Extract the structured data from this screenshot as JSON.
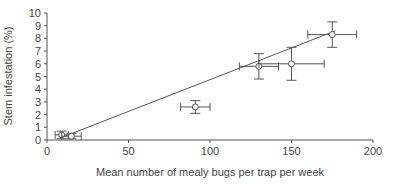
{
  "chart_data": {
    "type": "scatter",
    "title": "",
    "xlabel": "Mean number of mealy bugs per trap per week",
    "ylabel": "Stem infestation (%)",
    "xlim": [
      0,
      200
    ],
    "ylim": [
      0,
      10
    ],
    "xticks": [
      0,
      50,
      100,
      150,
      200
    ],
    "yticks": [
      0,
      1,
      2,
      3,
      4,
      5,
      6,
      7,
      8,
      9,
      10
    ],
    "grid": false,
    "legend": null,
    "series": [
      {
        "name": "observations",
        "marker": "open-circle",
        "points": [
          {
            "x": 9,
            "y": 0.4,
            "xerr": 4,
            "yerr": 0.3
          },
          {
            "x": 15,
            "y": 0.3,
            "xerr": 6,
            "yerr": 0.2
          },
          {
            "x": 91,
            "y": 2.6,
            "xerr": 9,
            "yerr": 0.5
          },
          {
            "x": 130,
            "y": 5.8,
            "xerr": 12,
            "yerr": 1.0
          },
          {
            "x": 150,
            "y": 6.0,
            "xerr": 20,
            "yerr": 1.3
          },
          {
            "x": 175,
            "y": 8.3,
            "xerr": 15,
            "yerr": 1.0
          }
        ]
      }
    ],
    "fit_line": {
      "x": [
        9,
        177
      ],
      "y": [
        0.2,
        8.6
      ]
    }
  }
}
